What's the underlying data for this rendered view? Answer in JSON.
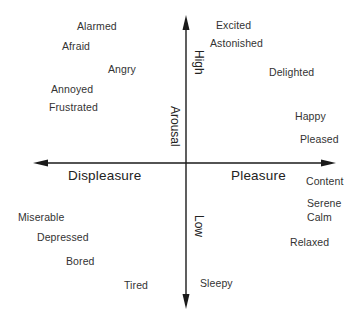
{
  "diagram": {
    "type": "circumplex-model-of-affect",
    "axes": {
      "horizontal": {
        "left_label": "Displeasure",
        "right_label": "Pleasure"
      },
      "vertical": {
        "name": "Arousal",
        "top_label": "High",
        "bottom_label": "Low"
      }
    },
    "emotions": [
      {
        "label": "Alarmed",
        "x": 77,
        "y": 20
      },
      {
        "label": "Afraid",
        "x": 62,
        "y": 40
      },
      {
        "label": "Angry",
        "x": 108,
        "y": 63
      },
      {
        "label": "Annoyed",
        "x": 51,
        "y": 83
      },
      {
        "label": "Frustrated",
        "x": 49,
        "y": 101
      },
      {
        "label": "Excited",
        "x": 216,
        "y": 19
      },
      {
        "label": "Astonished",
        "x": 210,
        "y": 37
      },
      {
        "label": "Delighted",
        "x": 269,
        "y": 66
      },
      {
        "label": "Happy",
        "x": 295,
        "y": 110
      },
      {
        "label": "Pleased",
        "x": 300,
        "y": 133
      },
      {
        "label": "Content",
        "x": 306,
        "y": 175
      },
      {
        "label": "Serene",
        "x": 307,
        "y": 197
      },
      {
        "label": "Calm",
        "x": 307,
        "y": 211
      },
      {
        "label": "Relaxed",
        "x": 290,
        "y": 236
      },
      {
        "label": "Miserable",
        "x": 18,
        "y": 211
      },
      {
        "label": "Depressed",
        "x": 37,
        "y": 231
      },
      {
        "label": "Bored",
        "x": 66,
        "y": 255
      },
      {
        "label": "Tired",
        "x": 124,
        "y": 279
      },
      {
        "label": "Sleepy",
        "x": 200,
        "y": 277
      }
    ],
    "colors": {
      "axis": "#1a1a1a",
      "text": "#333333",
      "background": "#ffffff"
    }
  }
}
